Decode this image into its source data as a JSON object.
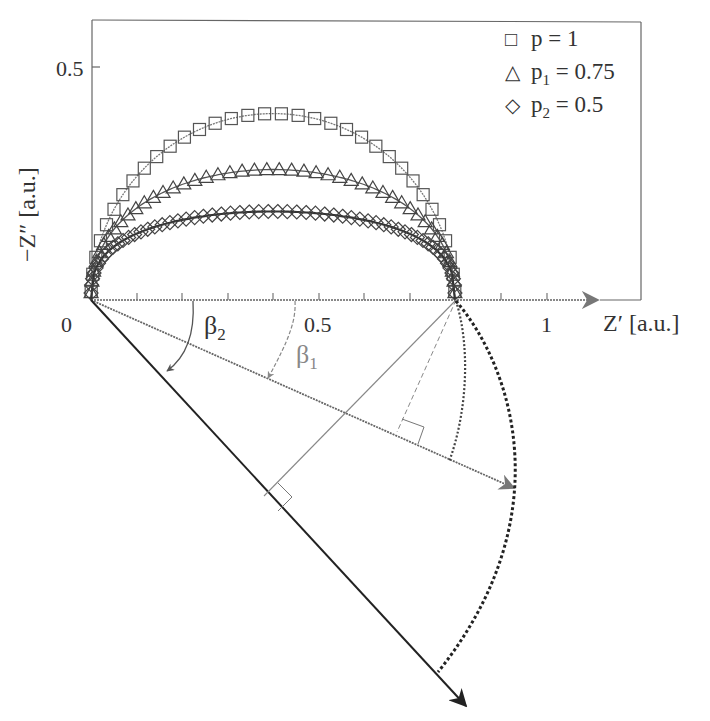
{
  "chart_data": {
    "type": "scatter",
    "title": "",
    "xlabel": "Z′ [a.u.]",
    "ylabel": "−Z″ [a.u.]",
    "x_ticks": [
      {
        "value": 0,
        "label": "0"
      },
      {
        "value": 0.5,
        "label": "0.5"
      },
      {
        "value": 1,
        "label": "1"
      }
    ],
    "y_ticks": [
      {
        "value": 0.5,
        "label": "0.5"
      }
    ],
    "xlim": [
      0,
      1.2
    ],
    "ylim": [
      0,
      0.55
    ],
    "legend_position": "upper right",
    "series": [
      {
        "name": "p = 1",
        "marker": "square",
        "p": 1,
        "R": 0.8,
        "peak": 0.4,
        "depression_angle_deg": 0
      },
      {
        "name": "p₁ = 0.75",
        "marker": "triangle",
        "p": 0.75,
        "R": 0.8,
        "peak": 0.28,
        "depression_angle_deg": 22.5
      },
      {
        "name": "p₂ = 0.5",
        "marker": "diamond",
        "p": 0.5,
        "R": 0.8,
        "peak": 0.19,
        "depression_angle_deg": 45
      }
    ],
    "annotations": [
      {
        "type": "angle",
        "label": "β₁",
        "sub": "1",
        "between": "Z′-axis and ray 1"
      },
      {
        "type": "angle",
        "label": "β₂",
        "sub": "2",
        "between": "Z′-axis and ray 2"
      },
      {
        "type": "ray",
        "name": "ray-beta1",
        "angle_deg": 23.9
      },
      {
        "type": "ray",
        "name": "ray-beta2",
        "angle_deg": 47.3
      },
      {
        "type": "perpendicular",
        "from": "Z′ = R",
        "to": "ray-beta1"
      },
      {
        "type": "perpendicular",
        "from": "Z′ = R",
        "to": "ray-beta2"
      },
      {
        "type": "arc",
        "style": "dotted",
        "from": "Z′ = R",
        "to": "ray-beta1"
      },
      {
        "type": "arc",
        "style": "dotted",
        "from": "Z′ = R",
        "to": "ray-beta2"
      }
    ]
  },
  "labels": {
    "x_tick_0": "0",
    "x_tick_05": "0.5",
    "x_tick_1": "1",
    "y_tick_05": "0.5",
    "x_axis_title": "Z′ [a.u.]",
    "y_axis_title": "−Z″ [a.u.]",
    "beta1_base": "β",
    "beta1_sub": "1",
    "beta2_base": "β",
    "beta2_sub": "2"
  },
  "legend": [
    {
      "symbol": "□",
      "base": "p",
      "sub": "",
      "rest": " = 1"
    },
    {
      "symbol": "△",
      "base": "p",
      "sub": "1",
      "rest": " = 0.75"
    },
    {
      "symbol": "◇",
      "base": "p",
      "sub": "2",
      "rest": " = 0.5"
    }
  ],
  "colors": {
    "frame": "#555555",
    "series_p1": "#777777",
    "series_p075": "#555555",
    "series_p05": "#333333",
    "ray1": "#666666",
    "ray2": "#222222",
    "arc": "#222222"
  }
}
